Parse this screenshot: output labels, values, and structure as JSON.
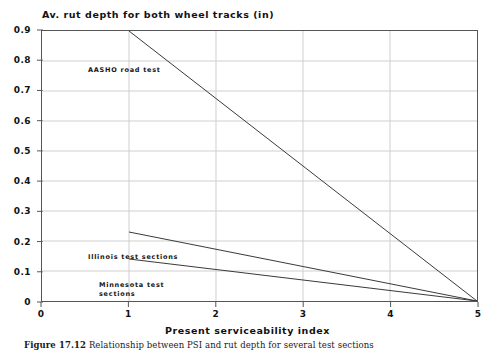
{
  "chart_data": {
    "type": "line",
    "title": "Av. rut depth for both wheel tracks (in)",
    "xlabel": "Present serviceability index",
    "ylabel": "",
    "xlim": [
      0,
      5
    ],
    "ylim": [
      0,
      0.9
    ],
    "grid": true,
    "legend_position": "inline-annotations",
    "x_ticks": [
      "0",
      "1",
      "2",
      "3",
      "4",
      "5"
    ],
    "x_tick_values": [
      0,
      1,
      2,
      3,
      4,
      5
    ],
    "y_ticks": [
      "0",
      "0.1",
      "0.2",
      "0.3",
      "0.4",
      "0.5",
      "0.6",
      "0.7",
      "0.8",
      "0.9"
    ],
    "y_tick_values": [
      0,
      0.1,
      0.2,
      0.3,
      0.4,
      0.5,
      0.6,
      0.7,
      0.8,
      0.9
    ],
    "series": [
      {
        "name": "AASHO road test",
        "x": [
          1,
          5
        ],
        "values": [
          0.9,
          0.0
        ],
        "color": "#3a3a3a"
      },
      {
        "name": "Illinois test sections",
        "x": [
          1,
          5
        ],
        "values": [
          0.23,
          0.0
        ],
        "color": "#3a3a3a"
      },
      {
        "name": "Minnesota test sections",
        "x": [
          1,
          5
        ],
        "values": [
          0.14,
          0.0
        ],
        "color": "#3a3a3a"
      }
    ],
    "annotations": [
      {
        "text": "AASHO road test",
        "x": 1.0,
        "y": 0.875
      },
      {
        "text": "Illinois test sections",
        "x": 1.0,
        "y": 0.265
      },
      {
        "text": "Minnesota test\nsections",
        "x": 1.15,
        "y": 0.175
      }
    ]
  },
  "figure": {
    "caption_label": "Figure 17.12",
    "caption_text": "Relationship between PSI and rut depth for several test sections"
  },
  "colors": {
    "axis": "#555555",
    "grid": "#cfcfcf",
    "line": "#3a3a3a",
    "text": "#121212"
  }
}
